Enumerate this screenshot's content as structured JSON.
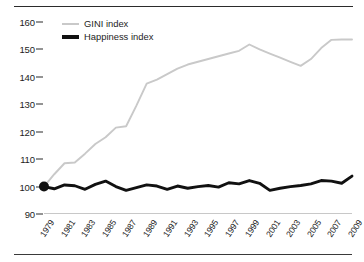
{
  "chart_data": {
    "type": "line",
    "title": "",
    "subtitle": "",
    "xlabel": "",
    "ylabel": "",
    "grid": false,
    "legend_position": "top-left",
    "xlim": [
      1979,
      2009
    ],
    "ylim": [
      90,
      160
    ],
    "ytick_labels": [
      "90",
      "100",
      "110",
      "120",
      "130",
      "140",
      "150",
      "160"
    ],
    "ytick_values": [
      90,
      100,
      110,
      120,
      130,
      140,
      150,
      160
    ],
    "xtick_labels": [
      "1979",
      "1981",
      "1983",
      "1985",
      "1987",
      "1989",
      "1991",
      "1993",
      "1995",
      "1997",
      "1999",
      "2001",
      "2003",
      "2005",
      "2007",
      "2009"
    ],
    "xtick_values": [
      1979,
      1981,
      1983,
      1985,
      1987,
      1989,
      1991,
      1993,
      1995,
      1997,
      1999,
      2001,
      2003,
      2005,
      2007,
      2009
    ],
    "x": [
      1979,
      1980,
      1981,
      1982,
      1983,
      1984,
      1985,
      1986,
      1987,
      1988,
      1989,
      1990,
      1991,
      1992,
      1993,
      1994,
      1995,
      1996,
      1997,
      1998,
      1999,
      2000,
      2001,
      2002,
      2003,
      2004,
      2005,
      2006,
      2007,
      2008,
      2009
    ],
    "series": [
      {
        "name": "GINI index",
        "color": "#c9c9c9",
        "values": [
          100.0,
          104.5,
          108.5,
          108.8,
          112.0,
          115.5,
          118.0,
          121.5,
          122.0,
          129.5,
          137.5,
          139.0,
          141.0,
          143.0,
          144.5,
          145.5,
          146.5,
          147.5,
          148.5,
          149.5,
          151.8,
          150.0,
          148.5,
          147.0,
          145.5,
          144.0,
          146.5,
          150.5,
          153.5,
          153.6,
          153.6
        ]
      },
      {
        "name": "Happiness index",
        "color": "#111111",
        "values": [
          100.0,
          99.2,
          100.6,
          100.3,
          99.0,
          100.8,
          102.0,
          100.0,
          98.6,
          99.6,
          100.6,
          100.2,
          99.0,
          100.2,
          99.4,
          100.0,
          100.4,
          99.8,
          101.4,
          101.0,
          102.2,
          101.2,
          98.6,
          99.4,
          100.0,
          100.4,
          101.0,
          102.2,
          102.0,
          101.2,
          103.8
        ]
      }
    ],
    "annotations": [
      {
        "name": "origin-marker",
        "x": 1979,
        "y": 100,
        "shape": "filled-circle",
        "color": "#111111"
      }
    ]
  },
  "legend": {
    "items": [
      {
        "label": "GINI index",
        "color": "#c9c9c9",
        "style": "thin-line"
      },
      {
        "label": "Happiness index",
        "color": "#111111",
        "style": "thick-line"
      }
    ]
  }
}
